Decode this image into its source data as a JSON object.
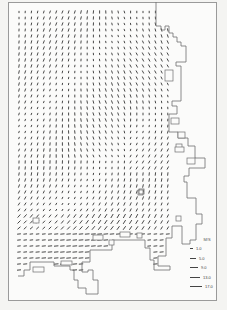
{
  "figure": {
    "type": "vector-field-map",
    "colors": {
      "arrow": "#333333",
      "coast": "#6e6e6e",
      "frame": "#9a9a9a",
      "background": "#fbfbfa"
    }
  },
  "grid": {
    "x0": 19,
    "y0": 12,
    "dx": 6.2,
    "dy": 6.0,
    "cols": 25,
    "rows": 44
  },
  "legend": {
    "unit": "M/S",
    "entries": [
      {
        "label": "1.0",
        "length": 3
      },
      {
        "label": "5.0",
        "length": 6
      },
      {
        "label": "9.0",
        "length": 8
      },
      {
        "label": "13.0",
        "length": 10
      },
      {
        "label": "17.0",
        "length": 12
      }
    ]
  },
  "coastline": [
    [
      156,
      2
    ],
    [
      156,
      26
    ],
    [
      161,
      26
    ],
    [
      161,
      30
    ],
    [
      165,
      30
    ],
    [
      165,
      26
    ],
    [
      169,
      26
    ],
    [
      169,
      33
    ],
    [
      173,
      33
    ],
    [
      173,
      37
    ],
    [
      177,
      37
    ],
    [
      177,
      42
    ],
    [
      181,
      42
    ],
    [
      181,
      46
    ],
    [
      186,
      46
    ],
    [
      186,
      62
    ],
    [
      176,
      62
    ],
    [
      176,
      66
    ],
    [
      181,
      66
    ],
    [
      181,
      101
    ],
    [
      172,
      101
    ],
    [
      172,
      106
    ],
    [
      177,
      106
    ],
    [
      177,
      114
    ],
    [
      169,
      114
    ],
    [
      169,
      132
    ],
    [
      178,
      132
    ],
    [
      178,
      138
    ],
    [
      188,
      138
    ],
    [
      188,
      146
    ],
    [
      195,
      146
    ],
    [
      195,
      158
    ],
    [
      205,
      158
    ],
    [
      205,
      168
    ],
    [
      189,
      168
    ],
    [
      189,
      176
    ],
    [
      184,
      176
    ],
    [
      184,
      182
    ],
    [
      187,
      182
    ],
    [
      187,
      198
    ],
    [
      196,
      198
    ],
    [
      196,
      214
    ],
    [
      202,
      214
    ],
    [
      202,
      224
    ],
    [
      196,
      224
    ],
    [
      196,
      240
    ],
    [
      190,
      240
    ],
    [
      190,
      244
    ],
    [
      182,
      244
    ],
    [
      182,
      226
    ],
    [
      172,
      226
    ],
    [
      172,
      238
    ],
    [
      166,
      238
    ],
    [
      166,
      256
    ],
    [
      158,
      256
    ],
    [
      158,
      266
    ],
    [
      170,
      266
    ],
    [
      170,
      270
    ],
    [
      154,
      270
    ],
    [
      154,
      260
    ],
    [
      150,
      260
    ],
    [
      150,
      248
    ],
    [
      145,
      248
    ],
    [
      145,
      240
    ],
    [
      112,
      240
    ],
    [
      112,
      250
    ],
    [
      90,
      250
    ],
    [
      90,
      262
    ],
    [
      82,
      262
    ],
    [
      82,
      272
    ],
    [
      88,
      272
    ],
    [
      88,
      270
    ],
    [
      93,
      270
    ],
    [
      93,
      280
    ],
    [
      98,
      280
    ],
    [
      98,
      294
    ],
    [
      86,
      294
    ],
    [
      86,
      288
    ],
    [
      78,
      288
    ],
    [
      78,
      280
    ],
    [
      74,
      280
    ],
    [
      74,
      270
    ],
    [
      70,
      270
    ],
    [
      70,
      266
    ],
    [
      54,
      266
    ],
    [
      54,
      262
    ],
    [
      30,
      262
    ],
    [
      30,
      270
    ],
    [
      24,
      270
    ],
    [
      24,
      276
    ],
    [
      18,
      276
    ]
  ],
  "inner_boxes": [
    [
      33,
      267,
      11,
      5
    ],
    [
      61,
      261,
      11,
      4
    ],
    [
      93,
      235,
      10,
      5
    ],
    [
      120,
      232,
      10,
      5
    ],
    [
      137,
      233,
      5,
      5
    ],
    [
      109,
      240,
      5,
      5
    ],
    [
      165,
      70,
      8,
      11
    ],
    [
      176,
      144,
      6,
      6
    ],
    [
      171,
      118,
      8,
      6
    ],
    [
      178,
      132,
      7,
      6
    ],
    [
      175,
      147,
      9,
      5
    ],
    [
      187,
      158,
      8,
      6
    ],
    [
      138,
      190,
      5,
      5
    ],
    [
      176,
      216,
      5,
      5
    ],
    [
      33,
      218,
      6,
      5
    ]
  ],
  "marker": {
    "x": 139,
    "y": 189,
    "size": 5
  }
}
